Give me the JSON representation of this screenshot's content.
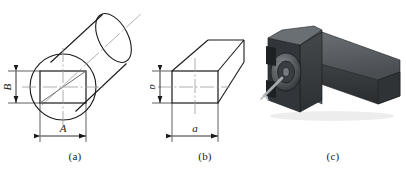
{
  "figure": {
    "background_color": "#ffffff",
    "line_color": "#1a1a1a",
    "center_line_color": "#9a9a9a",
    "panels": [
      {
        "id": "a",
        "caption": "(a)",
        "type": "line-drawing",
        "description": "Round bar (cylinder) in oblique projection with an inscribed rectangle on the end face",
        "dimensions": [
          {
            "name": "A",
            "label": "A",
            "orientation": "horizontal",
            "position": "below-end-face"
          },
          {
            "name": "B",
            "label": "B",
            "orientation": "vertical",
            "position": "left-of-end-face"
          }
        ]
      },
      {
        "id": "b",
        "caption": "(b)",
        "type": "line-drawing",
        "description": "Rectangular prism (finished blank) in oblique projection",
        "dimensions": [
          {
            "name": "a",
            "label": "a",
            "orientation": "horizontal",
            "position": "below-end-face"
          },
          {
            "name": "b",
            "label": "b",
            "orientation": "vertical",
            "position": "left-of-end-face"
          }
        ]
      },
      {
        "id": "c",
        "caption": "(c)",
        "type": "photograph",
        "description": "Dark grey metal tool holder / clamp fixture with knurled round clamp element and protruding pin, long rectangular arm extending to the right",
        "colors": {
          "body_dark": "#3b3f42",
          "body_mid": "#5a5f63",
          "body_light": "#7d8286",
          "shadow": "#23262a",
          "pin": "#aeb2b5"
        }
      }
    ]
  }
}
